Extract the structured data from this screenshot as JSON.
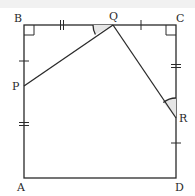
{
  "diagram": {
    "type": "geometry",
    "shape": "square",
    "stroke_color": "#2a2a2a",
    "arc_fill": "#e6e6e6",
    "points": {
      "A": {
        "label": "A",
        "x": 24,
        "y": 178
      },
      "B": {
        "label": "B",
        "x": 24,
        "y": 25
      },
      "C": {
        "label": "C",
        "x": 176,
        "y": 25
      },
      "D": {
        "label": "D",
        "x": 176,
        "y": 178
      },
      "P": {
        "label": "P",
        "x": 24,
        "y": 86
      },
      "Q": {
        "label": "Q",
        "x": 113,
        "y": 25
      },
      "R": {
        "label": "R",
        "x": 176,
        "y": 118
      }
    },
    "segments": [
      "AB",
      "BC",
      "CD",
      "DA",
      "PQ",
      "QR"
    ],
    "right_angles": [
      "B",
      "C"
    ],
    "equal_marks": {
      "single": [
        "BP",
        "QC",
        "RD"
      ],
      "double": [
        "PA",
        "BQ",
        "CR"
      ]
    },
    "marked_angles": [
      "BQP",
      "QRC"
    ]
  }
}
